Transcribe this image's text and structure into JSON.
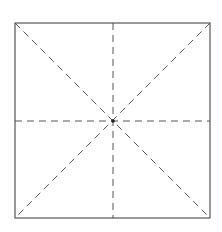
{
  "diagram": {
    "type": "square-with-fold-lines",
    "colors": {
      "background": "#ffffff",
      "outline": "#555555",
      "dashed": "#555555",
      "center_dot": "#222222"
    },
    "square": {
      "x1": 15,
      "y1": 23,
      "x2": 210,
      "y2": 218
    },
    "center": {
      "x": 113,
      "y": 121
    },
    "fold_lines": [
      {
        "name": "vertical",
        "x1": 113,
        "y1": 23,
        "x2": 113,
        "y2": 218
      },
      {
        "name": "horizontal",
        "x1": 15,
        "y1": 121,
        "x2": 210,
        "y2": 121
      },
      {
        "name": "diagonal-main",
        "x1": 15,
        "y1": 23,
        "x2": 210,
        "y2": 218
      },
      {
        "name": "diagonal-anti",
        "x1": 210,
        "y1": 23,
        "x2": 15,
        "y2": 218
      }
    ]
  }
}
